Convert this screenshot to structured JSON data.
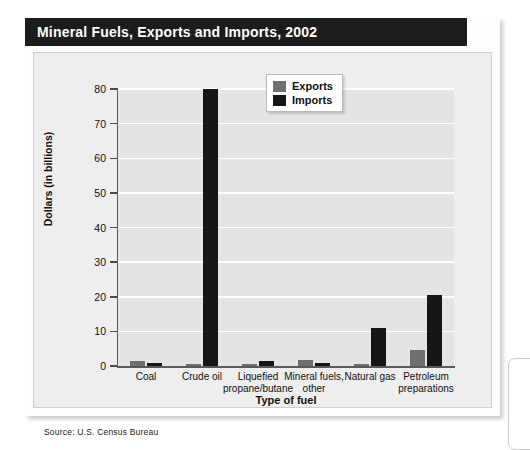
{
  "figure": {
    "title": "Mineral Fuels, Exports and Imports, 2002",
    "source": "Source: U.S. Census Bureau"
  },
  "legend": {
    "items": [
      {
        "label": "Exports",
        "color": "#6f6f6f"
      },
      {
        "label": "Imports",
        "color": "#161616"
      }
    ]
  },
  "axes": {
    "y_title": "Dollars (in billions)",
    "x_title": "Type of fuel",
    "y_ticks": [
      "0",
      "10",
      "20",
      "30",
      "40",
      "50",
      "60",
      "70",
      "80"
    ]
  },
  "categories": [
    {
      "line1": "Coal",
      "line2": ""
    },
    {
      "line1": "Crude oil",
      "line2": ""
    },
    {
      "line1": "Liquefied",
      "line2": "propane/butane"
    },
    {
      "line1": "Mineral fuels,",
      "line2": "other"
    },
    {
      "line1": "Natural gas",
      "line2": ""
    },
    {
      "line1": "Petroleum",
      "line2": "preparations"
    }
  ],
  "chart_data": {
    "type": "bar",
    "title": "Mineral Fuels, Exports and Imports, 2002",
    "xlabel": "Type of fuel",
    "ylabel": "Dollars (in billions)",
    "ylim": [
      0,
      80
    ],
    "ytick_step": 10,
    "grid": true,
    "legend_position": "top-center-right",
    "categories": [
      "Coal",
      "Crude oil",
      "Liquefied propane/butane",
      "Mineral fuels, other",
      "Natural gas",
      "Petroleum preparations"
    ],
    "series": [
      {
        "name": "Exports",
        "color": "#6f6f6f",
        "values": [
          1.4,
          0.2,
          0.6,
          1.6,
          0.4,
          4.7
        ]
      },
      {
        "name": "Imports",
        "color": "#161616",
        "values": [
          0.9,
          80.0,
          1.5,
          0.9,
          11.0,
          20.5
        ]
      }
    ],
    "units": "billions of U.S. dollars",
    "source": "Source: U.S. Census Bureau"
  }
}
